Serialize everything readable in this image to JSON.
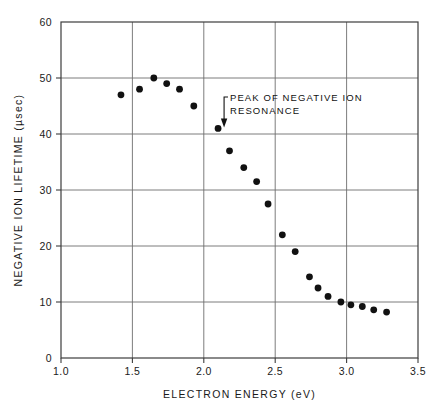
{
  "chart_data": {
    "type": "scatter",
    "title": "",
    "xlabel": "ELECTRON ENERGY (eV)",
    "ylabel": "NEGATIVE ION LIFETIME (µsec)",
    "xlim": [
      1.0,
      3.5
    ],
    "ylim": [
      0,
      60
    ],
    "xticks": [
      "1.0",
      "1.5",
      "2.0",
      "2.5",
      "3.0",
      "3.5"
    ],
    "xtick_values": [
      1.0,
      1.5,
      2.0,
      2.5,
      3.0,
      3.5
    ],
    "yticks": [
      "0",
      "10",
      "20",
      "30",
      "40",
      "50",
      "60"
    ],
    "ytick_values": [
      0,
      10,
      20,
      30,
      40,
      50,
      60
    ],
    "grid": true,
    "legend": "none",
    "series": [
      {
        "name": "negative ion lifetime",
        "marker": "filled-circle",
        "color": "#111111",
        "points": [
          [
            1.42,
            47.0
          ],
          [
            1.55,
            48.0
          ],
          [
            1.65,
            50.0
          ],
          [
            1.74,
            49.0
          ],
          [
            1.83,
            48.0
          ],
          [
            1.93,
            45.0
          ],
          [
            2.1,
            41.0
          ],
          [
            2.18,
            37.0
          ],
          [
            2.28,
            34.0
          ],
          [
            2.37,
            31.5
          ],
          [
            2.45,
            27.5
          ],
          [
            2.55,
            22.0
          ],
          [
            2.64,
            19.0
          ],
          [
            2.74,
            14.5
          ],
          [
            2.8,
            12.5
          ],
          [
            2.87,
            11.0
          ],
          [
            2.96,
            10.0
          ],
          [
            3.03,
            9.5
          ],
          [
            3.11,
            9.2
          ],
          [
            3.19,
            8.6
          ],
          [
            3.28,
            8.2
          ]
        ]
      }
    ],
    "annotations": [
      {
        "text_line1": "PEAK OF NEGATIVE ION",
        "text_line2": "RESONANCE",
        "points_to_x": 2.1,
        "points_to_y": 41.0
      }
    ]
  }
}
